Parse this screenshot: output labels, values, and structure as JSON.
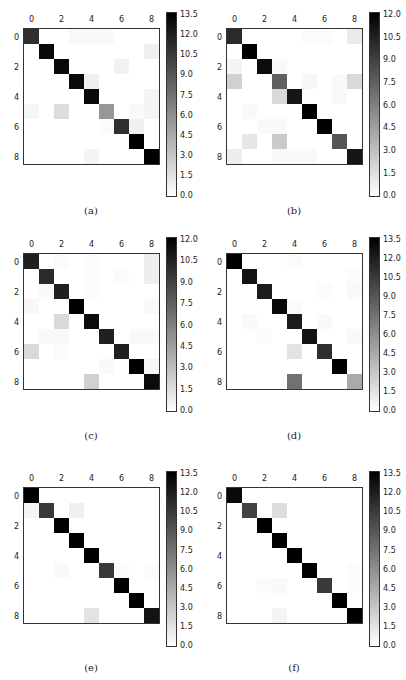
{
  "chart_data": [
    {
      "type": "heatmap",
      "caption": "(a)",
      "xticks": [
        "0",
        "2",
        "4",
        "6",
        "8"
      ],
      "yticks": [
        "0",
        "2",
        "4",
        "6",
        "8"
      ],
      "colorbar_ticks": [
        "13.5",
        "12.0",
        "10.5",
        "9.0",
        "7.5",
        "6.0",
        "4.5",
        "3.0",
        "1.5",
        "0.0"
      ],
      "vmax": 13.5,
      "matrix": [
        [
          11,
          0,
          0,
          0.3,
          0.3,
          0.3,
          0,
          0,
          0
        ],
        [
          0,
          13,
          0,
          0,
          0,
          0,
          0,
          0,
          0.8
        ],
        [
          0,
          0,
          13,
          0,
          0,
          0,
          0.7,
          0,
          0
        ],
        [
          0,
          0,
          0,
          13,
          0.8,
          0,
          0,
          0,
          0
        ],
        [
          0,
          0,
          0,
          0,
          13,
          0,
          0,
          0,
          0.6
        ],
        [
          0.5,
          0,
          1.8,
          0,
          0,
          5.5,
          0,
          0.3,
          0.6
        ],
        [
          0,
          0,
          0,
          0,
          0,
          0.2,
          11,
          0.8,
          0
        ],
        [
          0,
          0,
          0,
          0,
          0,
          0,
          0,
          13.5,
          0
        ],
        [
          0,
          0,
          0,
          0,
          0.6,
          0,
          0,
          0,
          13.5
        ]
      ]
    },
    {
      "type": "heatmap",
      "caption": "(b)",
      "xticks": [
        "0",
        "2",
        "4",
        "6",
        "8"
      ],
      "yticks": [
        "0",
        "2",
        "4",
        "6",
        "8"
      ],
      "colorbar_ticks": [
        "12.0",
        "10.5",
        "9.0",
        "7.5",
        "6.0",
        "4.5",
        "3.0",
        "1.5",
        "0.0"
      ],
      "vmax": 12.0,
      "matrix": [
        [
          10,
          0,
          0,
          0,
          0,
          0.2,
          0.2,
          0,
          1.0
        ],
        [
          0,
          12,
          0,
          0,
          0,
          0,
          0,
          0,
          0
        ],
        [
          0.5,
          0,
          11.5,
          0.3,
          0,
          0,
          0,
          0,
          0
        ],
        [
          2.2,
          0,
          0,
          7.5,
          0,
          0.4,
          0,
          0.3,
          1.8
        ],
        [
          0,
          0,
          0,
          1.8,
          11,
          0,
          0,
          0.3,
          0
        ],
        [
          0,
          0.3,
          0,
          0,
          0,
          12,
          0,
          0,
          0
        ],
        [
          0,
          0,
          0.3,
          0.3,
          0,
          0,
          12,
          0,
          0
        ],
        [
          0,
          1.2,
          0,
          2.5,
          0,
          0,
          0,
          8,
          0
        ],
        [
          0.8,
          0,
          0,
          0.3,
          0.3,
          0.3,
          0,
          0,
          11
        ]
      ]
    },
    {
      "type": "heatmap",
      "caption": "(c)",
      "xticks": [
        "0",
        "2",
        "4",
        "6",
        "8"
      ],
      "yticks": [
        "0",
        "2",
        "4",
        "6",
        "8"
      ],
      "colorbar_ticks": [
        "12.0",
        "10.5",
        "9.0",
        "7.5",
        "6.0",
        "4.5",
        "3.0",
        "1.5",
        "0.0"
      ],
      "vmax": 12.0,
      "matrix": [
        [
          10.5,
          0,
          0.2,
          0,
          0.2,
          0,
          0,
          0,
          0.8
        ],
        [
          0,
          10,
          0,
          0,
          0.2,
          0,
          0.2,
          0,
          0.8
        ],
        [
          0,
          0.3,
          10.5,
          0,
          0.2,
          0,
          0,
          0,
          0
        ],
        [
          0.4,
          0,
          0,
          12,
          0,
          0,
          0,
          0,
          0.3
        ],
        [
          0,
          0,
          1.8,
          0,
          11.5,
          0,
          0,
          0,
          0
        ],
        [
          0,
          0.3,
          0.3,
          0,
          0,
          10.5,
          0,
          0.3,
          0.3
        ],
        [
          1.8,
          0,
          0.2,
          0,
          0,
          0,
          10.5,
          0,
          0
        ],
        [
          0,
          0,
          0,
          0,
          0,
          0.3,
          0,
          12,
          0.4
        ],
        [
          0,
          0,
          0,
          0,
          2.2,
          0,
          0,
          0,
          11.5
        ]
      ]
    },
    {
      "type": "heatmap",
      "caption": "(d)",
      "xticks": [
        "0",
        "2",
        "4",
        "6",
        "8"
      ],
      "yticks": [
        "0",
        "2",
        "4",
        "6",
        "8"
      ],
      "colorbar_ticks": [
        "13.5",
        "12.0",
        "10.5",
        "9.0",
        "7.5",
        "6.0",
        "4.5",
        "3.0",
        "1.5",
        "0.0"
      ],
      "vmax": 13.5,
      "matrix": [
        [
          13.5,
          0,
          0,
          0,
          0.2,
          0,
          0,
          0,
          0
        ],
        [
          0,
          12.5,
          0,
          0,
          0,
          0,
          0,
          0,
          0.2
        ],
        [
          0,
          0,
          12,
          0,
          0,
          0,
          0.2,
          0,
          0.3
        ],
        [
          0,
          0,
          0,
          13,
          0.2,
          0,
          0,
          0,
          0
        ],
        [
          0,
          0.3,
          0,
          0,
          12,
          0,
          0.3,
          0,
          0
        ],
        [
          0,
          0,
          0.2,
          0,
          0,
          12.5,
          0,
          0,
          0.3
        ],
        [
          0,
          0,
          0,
          0,
          1.5,
          0,
          11,
          0,
          0
        ],
        [
          0,
          0,
          0,
          0,
          0,
          0,
          0,
          13.5,
          0
        ],
        [
          0,
          0,
          0,
          0,
          7.5,
          0,
          0,
          0,
          4.5
        ]
      ]
    },
    {
      "type": "heatmap",
      "caption": "(e)",
      "xticks": [
        "0",
        "2",
        "4",
        "6",
        "8"
      ],
      "yticks": [
        "0",
        "2",
        "4",
        "6",
        "8"
      ],
      "colorbar_ticks": [
        "13.5",
        "12.0",
        "10.5",
        "9.0",
        "7.5",
        "6.0",
        "4.5",
        "3.0",
        "1.5",
        "0.0"
      ],
      "vmax": 13.5,
      "matrix": [
        [
          13.5,
          0,
          0,
          0,
          0,
          0,
          0,
          0,
          0
        ],
        [
          0.6,
          10.5,
          0,
          0.8,
          0,
          0,
          0,
          0,
          0
        ],
        [
          0,
          0,
          13.5,
          0,
          0,
          0,
          0,
          0,
          0
        ],
        [
          0,
          0,
          0,
          13.5,
          0,
          0,
          0,
          0,
          0
        ],
        [
          0,
          0,
          0,
          0,
          13.5,
          0,
          0,
          0,
          0
        ],
        [
          0,
          0,
          0.3,
          0,
          0,
          10.5,
          0.2,
          0,
          0.2
        ],
        [
          0,
          0,
          0,
          0,
          0,
          0,
          13.5,
          0,
          0
        ],
        [
          0,
          0,
          0,
          0,
          0,
          0,
          0,
          13.5,
          0
        ],
        [
          0,
          0,
          0,
          0,
          1.5,
          0,
          0,
          0,
          12.5
        ]
      ]
    },
    {
      "type": "heatmap",
      "caption": "(f)",
      "xticks": [
        "0",
        "2",
        "4",
        "6",
        "8"
      ],
      "yticks": [
        "0",
        "2",
        "4",
        "6",
        "8"
      ],
      "colorbar_ticks": [
        "13.5",
        "12.0",
        "10.5",
        "9.0",
        "7.5",
        "6.0",
        "4.5",
        "3.0",
        "1.5",
        "0.0"
      ],
      "vmax": 13.5,
      "matrix": [
        [
          13,
          0,
          0,
          0,
          0,
          0,
          0,
          0,
          0
        ],
        [
          0,
          10,
          0,
          1.8,
          0,
          0,
          0,
          0,
          0
        ],
        [
          0,
          0,
          13.5,
          0,
          0,
          0,
          0,
          0,
          0
        ],
        [
          0,
          0,
          0,
          13.5,
          0,
          0,
          0,
          0,
          0
        ],
        [
          0,
          0,
          0,
          0,
          13.5,
          0,
          0,
          0,
          0
        ],
        [
          0,
          0,
          0,
          0,
          0,
          13.5,
          0,
          0,
          0.2
        ],
        [
          0,
          0,
          0.2,
          0.3,
          0,
          0,
          10.5,
          0,
          0.2
        ],
        [
          0,
          0,
          0,
          0,
          0,
          0,
          0,
          13.5,
          0
        ],
        [
          0,
          0,
          0,
          0.6,
          0,
          0,
          0,
          0,
          13.5
        ]
      ]
    }
  ],
  "panels": [
    {
      "caption": "(a)"
    },
    {
      "caption": "(b)"
    },
    {
      "caption": "(c)"
    },
    {
      "caption": "(d)"
    },
    {
      "caption": "(e)"
    },
    {
      "caption": "(f)"
    }
  ]
}
